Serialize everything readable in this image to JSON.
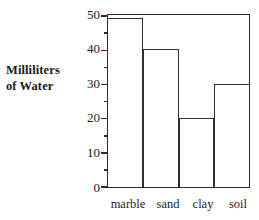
{
  "chart_data": {
    "type": "bar",
    "title": "",
    "xlabel": "",
    "ylabel": "Milliliters of Water",
    "ylabel_lines": [
      "Milliliters",
      "of Water"
    ],
    "categories": [
      "marble",
      "sand",
      "clay",
      "soil"
    ],
    "values": [
      49,
      40,
      20,
      30
    ],
    "ylim": [
      0,
      50
    ],
    "ytick_labels": [
      "0",
      "10",
      "20",
      "30",
      "40",
      "50"
    ],
    "ytick_values": [
      0,
      10,
      20,
      30,
      40,
      50
    ],
    "yminor_tick_values": [
      5,
      15,
      25,
      35,
      45
    ],
    "grid": false,
    "legend": false,
    "legend_position": "none",
    "bar_fill": "#ffffff",
    "bar_outline": "#2f2f2f",
    "axis_color": "#2b2b2b",
    "background": "#ffffff",
    "bars_touching": true,
    "frame": "closed-box",
    "series": [
      {
        "name": "Milliliters of Water",
        "values": [
          49,
          40,
          20,
          30
        ]
      }
    ]
  }
}
